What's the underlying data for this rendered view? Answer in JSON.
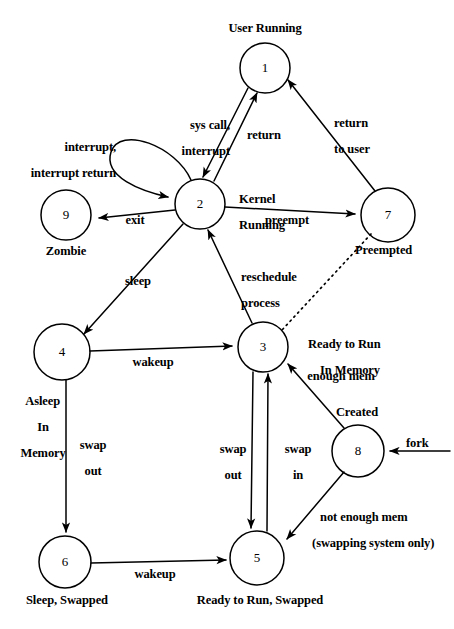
{
  "diagram": {
    "type": "state-transition-diagram",
    "states": [
      {
        "id": "1",
        "number": "1",
        "label": "User Running",
        "cx": 265,
        "cy": 68,
        "r": 25,
        "label_pos": "above"
      },
      {
        "id": "2",
        "number": "2",
        "label": "Kernel\nRunning",
        "cx": 200,
        "cy": 204,
        "r": 25,
        "label_pos": "right"
      },
      {
        "id": "3",
        "number": "3",
        "label": "Ready to Run\nIn Memory",
        "cx": 263,
        "cy": 347,
        "r": 25,
        "label_pos": "right"
      },
      {
        "id": "4",
        "number": "4",
        "label": "Asleep\nIn\nMemory",
        "cx": 62,
        "cy": 352,
        "r": 28,
        "label_pos": "below-left"
      },
      {
        "id": "5",
        "number": "5",
        "label": "Ready to Run, Swapped",
        "cx": 257,
        "cy": 558,
        "r": 27,
        "label_pos": "below"
      },
      {
        "id": "6",
        "number": "6",
        "label": "Sleep, Swapped",
        "cx": 65,
        "cy": 562,
        "r": 26,
        "label_pos": "below"
      },
      {
        "id": "7",
        "number": "7",
        "label": "Preempted",
        "cx": 388,
        "cy": 215,
        "r": 27,
        "label_pos": "below-right"
      },
      {
        "id": "8",
        "number": "8",
        "label": "Created",
        "cx": 358,
        "cy": 451,
        "r": 26,
        "label_pos": "above"
      },
      {
        "id": "9",
        "number": "9",
        "label": "Zombie",
        "cx": 66,
        "cy": 215,
        "r": 25,
        "label_pos": "below"
      }
    ],
    "transitions": [
      {
        "from": "1",
        "to": "2",
        "label": "sys call,\ninterrupt",
        "style": "solid"
      },
      {
        "from": "2",
        "to": "1",
        "label": "return",
        "style": "solid"
      },
      {
        "from": "7",
        "to": "1",
        "label": "return\nto user",
        "style": "solid"
      },
      {
        "from": "2",
        "to": "2",
        "label": "interrupt,\ninterrupt return",
        "style": "solid-self-loop"
      },
      {
        "from": "2",
        "to": "9",
        "label": "exit",
        "style": "solid"
      },
      {
        "from": "2",
        "to": "7",
        "label": "preempt",
        "style": "solid"
      },
      {
        "from": "7",
        "to": "3",
        "label": "",
        "style": "dotted"
      },
      {
        "from": "3",
        "to": "2",
        "label": "reschedule\nprocess",
        "style": "solid"
      },
      {
        "from": "2",
        "to": "4",
        "label": "sleep",
        "style": "solid"
      },
      {
        "from": "4",
        "to": "3",
        "label": "wakeup",
        "style": "solid"
      },
      {
        "from": "4",
        "to": "6",
        "label": "swap\nout",
        "style": "solid"
      },
      {
        "from": "3",
        "to": "5",
        "label": "swap\nout",
        "style": "solid"
      },
      {
        "from": "5",
        "to": "3",
        "label": "swap\nin",
        "style": "solid"
      },
      {
        "from": "6",
        "to": "5",
        "label": "wakeup",
        "style": "solid"
      },
      {
        "from": "8",
        "to": "3",
        "label": "enough mem",
        "style": "solid"
      },
      {
        "from": "8",
        "to": "5",
        "label": "not enough mem\n(swapping system only)",
        "style": "solid"
      },
      {
        "from": "external",
        "to": "8",
        "label": "fork",
        "style": "solid"
      }
    ],
    "labels": {
      "user_running": "User Running",
      "kernel_running_l1": "Kernel",
      "kernel_running_l2": "Running",
      "zombie": "Zombie",
      "preempted": "Preempted",
      "ready_mem_l1": "Ready to Run",
      "ready_mem_l2": "In Memory",
      "asleep_mem_l1": "Asleep",
      "asleep_mem_l2": "In",
      "asleep_mem_l3": "Memory",
      "created": "Created",
      "sleep_swapped": "Sleep, Swapped",
      "ready_swapped": "Ready to Run, Swapped",
      "syscall_l1": "sys call,",
      "syscall_l2": "interrupt",
      "return": "return",
      "return_user_l1": "return",
      "return_user_l2": "to user",
      "interrupt_l1": "interrupt,",
      "interrupt_l2": "interrupt return",
      "exit": "exit",
      "preempt": "preempt",
      "reschedule_l1": "reschedule",
      "reschedule_l2": "process",
      "sleep": "sleep",
      "wakeup_4_3": "wakeup",
      "wakeup_6_5": "wakeup",
      "swap_out_4_6_l1": "swap",
      "swap_out_4_6_l2": "out",
      "swap_out_3_5_l1": "swap",
      "swap_out_3_5_l2": "out",
      "swap_in_5_3_l1": "swap",
      "swap_in_5_3_l2": "in",
      "enough_mem": "enough mem",
      "not_enough_mem_l1": "not enough mem",
      "not_enough_mem_l2": "(swapping system only)",
      "fork": "fork"
    },
    "numbers": {
      "n1": "1",
      "n2": "2",
      "n3": "3",
      "n4": "4",
      "n5": "5",
      "n6": "6",
      "n7": "7",
      "n8": "8",
      "n9": "9"
    },
    "colors": {
      "stroke": "#000000",
      "background": "#ffffff",
      "text": "#000000"
    }
  }
}
